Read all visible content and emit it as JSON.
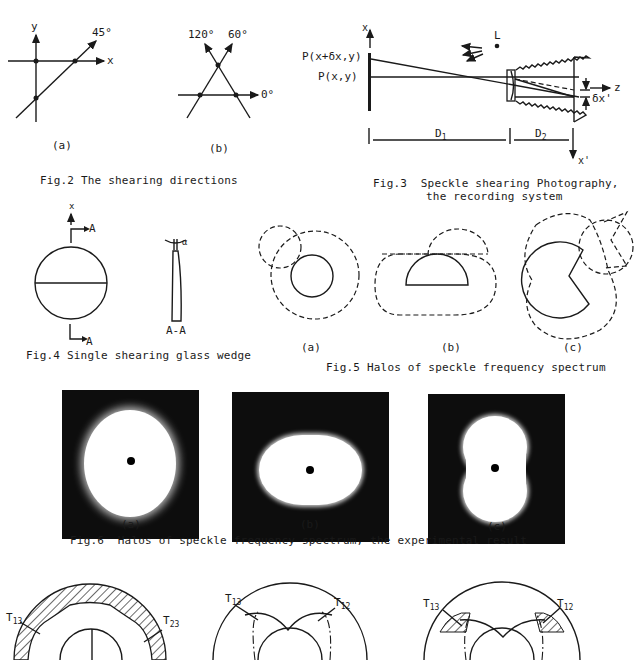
{
  "fig2": {
    "caption": "Fig.2 The shearing directions",
    "panel_a": {
      "label": "(a)",
      "axis_y": "y",
      "axis_x": "x",
      "angle": "45°"
    },
    "panel_b": {
      "label": "(b)",
      "angle_120": "120°",
      "angle_60": "60°",
      "angle_0": "0°"
    }
  },
  "fig3": {
    "caption_line1": "Fig.3  Speckle shearing Photography,",
    "caption_line2": "the recording system",
    "label_x": "x",
    "label_p_shift": "P(x+δx,y)",
    "label_p": "P(x,y)",
    "label_light": "L",
    "label_z": "z",
    "label_dx": "δx'",
    "label_d1": "D",
    "label_d1_sub": "1",
    "label_d2": "D",
    "label_d2_sub": "2",
    "label_xprime": "x'"
  },
  "fig4": {
    "caption": "Fig.4 Single shearing glass wedge",
    "axis_x": "x",
    "section_top": "A",
    "section_bottom": "A",
    "section_label": "A-A",
    "angle": "α"
  },
  "fig5": {
    "caption": "Fig.5 Halos of speckle frequency spectrum",
    "labels": [
      "(a)",
      "(b)",
      "(c)"
    ]
  },
  "fig6": {
    "caption": "Fig.6  Halos of speckle frequency spectrum, the experimental result",
    "labels": [
      "(a)",
      "(b)",
      "(c)"
    ]
  },
  "fig7": {
    "panel_a": {
      "t13": "T",
      "t13_sub": "13",
      "t23": "T",
      "t23_sub": "23"
    },
    "panel_b": {
      "t13": "T",
      "t13_sub": "13",
      "t12": "T",
      "t12_sub": "12"
    },
    "panel_c": {
      "t13": "T",
      "t13_sub": "13",
      "t12": "T",
      "t12_sub": "12"
    }
  }
}
